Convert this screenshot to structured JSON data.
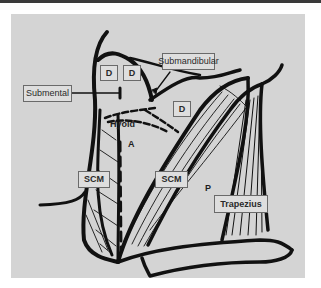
{
  "figure": {
    "type": "anatomical-diagram",
    "colors": {
      "background": "#d4d4d4",
      "ink": "#111111",
      "label_fill": "#dedede",
      "label_border": "#6a6a6a"
    }
  },
  "labels": {
    "submental": "Submental",
    "submandibular": "Submandibular",
    "digastric_1": "D",
    "digastric_2": "D",
    "digastric_3": "D",
    "hyoid": "Hyoid",
    "anterior_triangle": "A",
    "scm_left": "SCM",
    "scm_right": "SCM",
    "posterior_triangle": "P",
    "trapezius": "Trapezius"
  }
}
